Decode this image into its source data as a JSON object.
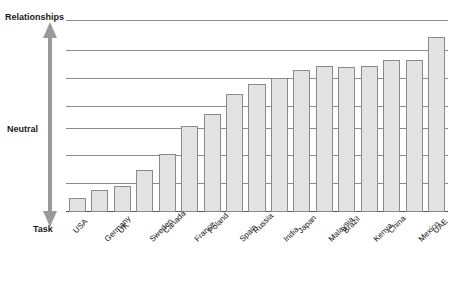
{
  "chart_data": {
    "type": "bar",
    "title": "",
    "subtitle": "",
    "xlabel": "",
    "ylabel": "",
    "axis_poles": {
      "top": "Relationships",
      "middle": "Neutral",
      "bottom": "Task"
    },
    "grid": true,
    "gridline_count": 8,
    "legend": null,
    "ylim": [
      0,
      8
    ],
    "categories": [
      "USA",
      "Germany",
      "UK",
      "Sweden",
      "Canada",
      "France",
      "Poland",
      "Spain",
      "Russia",
      "India",
      "Japan",
      "Malaysia",
      "Brazil",
      "Kenya",
      "China",
      "Mexico",
      "UAE"
    ],
    "values": [
      0.6,
      0.9,
      1.1,
      1.75,
      2.4,
      3.6,
      4.1,
      4.9,
      5.35,
      5.6,
      5.9,
      6.1,
      6.05,
      6.1,
      6.35,
      6.35,
      7.3
    ],
    "series": [
      {
        "name": "Task-Relationships orientation",
        "values": [
          0.6,
          0.9,
          1.1,
          1.75,
          2.4,
          3.6,
          4.1,
          4.9,
          5.35,
          5.6,
          5.9,
          6.1,
          6.05,
          6.1,
          6.35,
          6.35,
          7.3
        ]
      }
    ],
    "colors": {
      "bar_fill": "#e3e3e3",
      "bar_border": "#8a8a8a",
      "gridline": "#8c8c8c",
      "arrow": "#9a9a9a",
      "text": "#111111"
    }
  },
  "axis": {
    "top_label": "Relationships",
    "middle_label": "Neutral",
    "bottom_label": "Task",
    "arrow_name": "vertical-double-arrow"
  }
}
